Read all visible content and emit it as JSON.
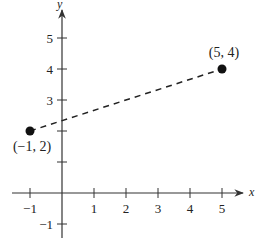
{
  "chart_data": {
    "type": "scatter",
    "title": "",
    "xlabel": "x",
    "ylabel": "y",
    "xlim": [
      -1.5,
      6
    ],
    "ylim": [
      -1.5,
      6
    ],
    "grid": false,
    "x_ticks": [
      -1,
      1,
      2,
      3,
      4,
      5
    ],
    "x_tick_labels": [
      "−1",
      "1",
      "2",
      "3",
      "4",
      "5"
    ],
    "y_ticks": [
      -1,
      1,
      2,
      3,
      4,
      5
    ],
    "y_tick_labels": [
      "−1",
      "",
      "",
      "3",
      "4",
      "5"
    ],
    "points": [
      {
        "x": -1,
        "y": 2,
        "label": "(−1, 2)"
      },
      {
        "x": 5,
        "y": 4,
        "label": "(5, 4)"
      }
    ],
    "segments": [
      {
        "from": [
          -1,
          2
        ],
        "to": [
          5,
          4
        ],
        "style": "dashed"
      }
    ],
    "colors": {
      "ink": "#222222",
      "background": "#ffffff"
    }
  }
}
